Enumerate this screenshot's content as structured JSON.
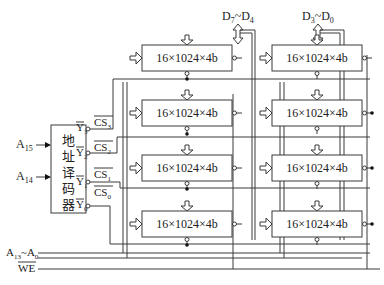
{
  "decoder": {
    "label_chars": [
      "地",
      "址",
      "译",
      "码",
      "器"
    ],
    "inputs": [
      {
        "main": "A",
        "sub": "15"
      },
      {
        "main": "A",
        "sub": "14"
      }
    ],
    "outputs": [
      {
        "main": "Y",
        "sub": "3"
      },
      {
        "main": "Y",
        "sub": "2"
      },
      {
        "main": "Y",
        "sub": "1"
      },
      {
        "main": "Y",
        "sub": "0"
      }
    ],
    "cs_labels": [
      {
        "main": "CS",
        "sub": "3"
      },
      {
        "main": "CS",
        "sub": "2"
      },
      {
        "main": "CS",
        "sub": "1"
      },
      {
        "main": "CS",
        "sub": "0"
      }
    ]
  },
  "buses": {
    "high_data": {
      "main1": "D",
      "sub1": "7",
      "sep": "~",
      "main2": "D",
      "sub2": "4"
    },
    "low_data": {
      "main1": "D",
      "sub1": "3",
      "sep": "~",
      "main2": "D",
      "sub2": "0"
    },
    "address": {
      "main1": "A",
      "sub1": "13",
      "sep": "~",
      "main2": "A",
      "sub2": "0"
    },
    "write_enable": "WE"
  },
  "chips": {
    "label": "16×1024×4b",
    "left_column": [
      "16×1024×4b",
      "16×1024×4b",
      "16×1024×4b",
      "16×1024×4b"
    ],
    "right_column": [
      "16×1024×4b",
      "16×1024×4b",
      "16×1024×4b",
      "16×1024×4b"
    ]
  }
}
